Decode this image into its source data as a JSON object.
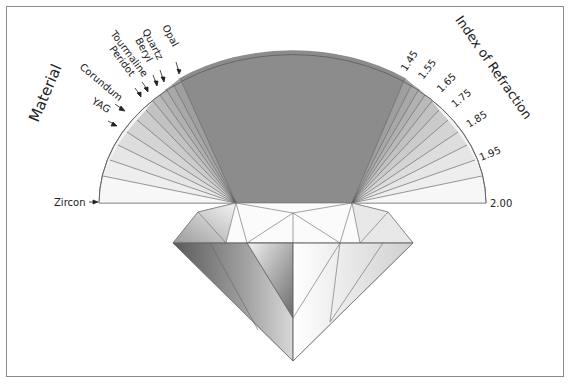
{
  "figure": {
    "left_axis_title": "Material",
    "right_axis_title": "Index of Refraction",
    "materials": [
      {
        "name": "Opal",
        "label": "Opal"
      },
      {
        "name": "Quartz",
        "label": "Quartz"
      },
      {
        "name": "Beryl",
        "label": "Beryl"
      },
      {
        "name": "Tourmaline",
        "label": "Tourmaline"
      },
      {
        "name": "Peridot",
        "label": "Peridot"
      },
      {
        "name": "Corundum",
        "label": "Corundum"
      },
      {
        "name": "YAG",
        "label": "YAG"
      },
      {
        "name": "Zircon",
        "label": "Zircon"
      }
    ],
    "refraction_ticks": [
      "1.45",
      "1.55",
      "1.65",
      "1.75",
      "1.85",
      "1.95",
      "2.00"
    ],
    "colors": {
      "critical_zone": "#8c8c8c",
      "fan_outline": "#555555",
      "frame": "#8a8a8a",
      "text": "#222222"
    }
  }
}
